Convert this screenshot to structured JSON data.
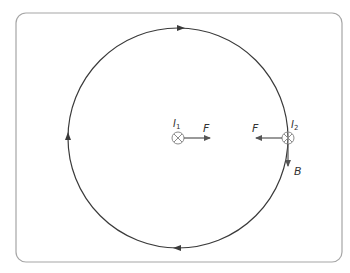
{
  "diagram": {
    "colors": {
      "frame": "#a6a6a6",
      "line": "#3a3a3a",
      "symbol": "#8c8c8c",
      "arrow": "#555555",
      "text": "#333333"
    },
    "circle": {
      "cx": 178,
      "cy": 138,
      "r": 110,
      "direction": "clockwise"
    },
    "wire1": {
      "label": "I",
      "subscript": "1",
      "x": 178,
      "y": 138,
      "symbol": "cross-into-page"
    },
    "wire2": {
      "label": "I",
      "subscript": "2",
      "x": 288,
      "y": 138,
      "symbol": "cross-into-page"
    },
    "force_on_wire1": {
      "label": "F",
      "direction": "right"
    },
    "force_on_wire2": {
      "label": "F",
      "direction": "left"
    },
    "field_vector": {
      "label": "B",
      "direction": "down"
    }
  }
}
